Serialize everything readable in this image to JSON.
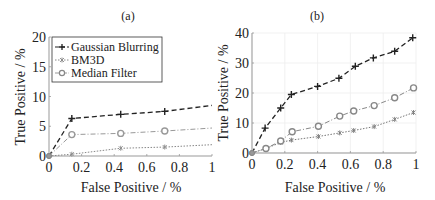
{
  "chart_data": [
    {
      "panel": "(a)",
      "type": "line",
      "title": "(a)",
      "xlabel": "False Positive / %",
      "ylabel": "True Positive / %",
      "xlim": [
        0,
        1
      ],
      "ylim": [
        0,
        20
      ],
      "xticks": [
        "0",
        "0.2",
        "0.4",
        "0.6",
        "0.8",
        "1"
      ],
      "yticks": [
        "0",
        "5",
        "10",
        "15",
        "20"
      ],
      "grid": false,
      "legend_position": "upper left",
      "series": [
        {
          "name": "Gaussian Blurring",
          "marker": "+",
          "linestyle": "dashed",
          "color": "#222222",
          "x": [
            0,
            0.14,
            0.44,
            0.71,
            1.0
          ],
          "y": [
            0,
            6.3,
            7.0,
            7.5,
            8.5
          ]
        },
        {
          "name": "BM3D",
          "marker": "*",
          "linestyle": "dotted",
          "color": "#888888",
          "x": [
            0,
            0.14,
            0.44,
            0.71,
            1.0
          ],
          "y": [
            0,
            0.3,
            1.3,
            1.5,
            1.9
          ]
        },
        {
          "name": "Median Filter",
          "marker": "o",
          "linestyle": "dashdot",
          "color": "#999999",
          "x": [
            0,
            0.14,
            0.44,
            0.71,
            1.0
          ],
          "y": [
            0,
            3.6,
            3.8,
            4.2,
            4.7
          ]
        }
      ]
    },
    {
      "panel": "(b)",
      "type": "line",
      "title": "(b)",
      "xlabel": "False Positive / %",
      "ylabel": "True Positive / %",
      "xlim": [
        0,
        1
      ],
      "ylim": [
        0,
        40
      ],
      "xticks": [
        "0",
        "0.2",
        "0.4",
        "0.6",
        "0.8",
        "1"
      ],
      "yticks": [
        "0",
        "10",
        "20",
        "30",
        "40"
      ],
      "grid": true,
      "series": [
        {
          "name": "Gaussian Blurring",
          "marker": "+",
          "linestyle": "dashed",
          "color": "#222222",
          "x": [
            0,
            0.08,
            0.175,
            0.24,
            0.4,
            0.53,
            0.63,
            0.74,
            0.87,
            0.98
          ],
          "y": [
            0,
            8.3,
            15.0,
            19.5,
            22.2,
            24.9,
            28.9,
            31.7,
            33.9,
            38.4
          ]
        },
        {
          "name": "BM3D",
          "marker": "*",
          "linestyle": "dotted",
          "color": "#777777",
          "x": [
            0,
            0.085,
            0.175,
            0.24,
            0.405,
            0.535,
            0.62,
            0.745,
            0.87,
            0.985
          ],
          "y": [
            0,
            1.5,
            3.5,
            4.3,
            5.5,
            6.7,
            7.5,
            8.8,
            11.2,
            13.5
          ]
        },
        {
          "name": "Median Filter",
          "marker": "o",
          "linestyle": "dashdot",
          "color": "#888888",
          "x": [
            0,
            0.085,
            0.175,
            0.245,
            0.405,
            0.535,
            0.62,
            0.745,
            0.87,
            0.985
          ],
          "y": [
            0,
            1.5,
            4.0,
            7.1,
            8.9,
            12.3,
            14.0,
            15.8,
            18.4,
            21.7
          ]
        }
      ]
    }
  ],
  "panels": [
    {
      "title": "(a)",
      "xlabel": "False Positive / %",
      "ylabel": "True Positive / %"
    },
    {
      "title": "(b)",
      "xlabel": "False Positive / %",
      "ylabel": "True Positive / %"
    }
  ],
  "legend": {
    "items": [
      "Gaussian Blurring",
      "BM3D",
      "Median Filter"
    ]
  }
}
